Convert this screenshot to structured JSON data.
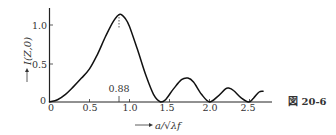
{
  "figure": {
    "caption": "図 20-6"
  },
  "chart_data": {
    "type": "line",
    "title": "",
    "xlabel": "a/√λf",
    "ylabel": "I(Z,0)",
    "xlim": [
      0,
      2.8
    ],
    "ylim": [
      0,
      1.2
    ],
    "x_ticks": [
      "0",
      "0.5",
      "1.0",
      "1.5",
      "2.0",
      "2.5"
    ],
    "y_ticks": [
      "0",
      "0.5",
      "1.0"
    ],
    "grid": false,
    "legend": null,
    "annotations": [
      {
        "text": "0.88",
        "x": 0.88,
        "note": "dashed vertical line marking the main maximum at a/√λf = 0.88"
      }
    ],
    "series": [
      {
        "name": "I(Z,0)",
        "x": [
          0,
          0.1,
          0.2,
          0.3,
          0.4,
          0.5,
          0.6,
          0.7,
          0.8,
          0.88,
          0.95,
          1.0,
          1.1,
          1.2,
          1.3,
          1.39,
          1.45,
          1.55,
          1.65,
          1.73,
          1.8,
          1.9,
          2.0,
          2.1,
          2.2,
          2.24,
          2.3,
          2.4,
          2.49,
          2.55,
          2.62,
          2.67
        ],
        "values": [
          0,
          0.03,
          0.1,
          0.2,
          0.31,
          0.43,
          0.62,
          0.85,
          1.05,
          1.14,
          1.08,
          0.98,
          0.68,
          0.36,
          0.1,
          0.0,
          0.03,
          0.17,
          0.29,
          0.31,
          0.26,
          0.1,
          0.0,
          0.07,
          0.17,
          0.18,
          0.15,
          0.05,
          0.0,
          0.05,
          0.13,
          0.14
        ]
      }
    ]
  }
}
